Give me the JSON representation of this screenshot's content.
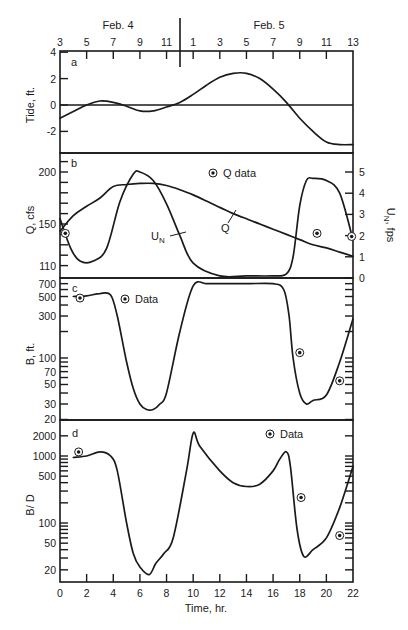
{
  "figure": {
    "top_axis": {
      "date_labels": [
        "Feb. 4",
        "Feb. 5"
      ],
      "hour_ticks": [
        "3",
        "5",
        "7",
        "9",
        "11",
        "1",
        "3",
        "5",
        "7",
        "9",
        "11",
        "13"
      ]
    },
    "bottom_axis": {
      "label": "Time, hr.",
      "ticks": [
        "0",
        "2",
        "4",
        "6",
        "8",
        "10",
        "12",
        "14",
        "16",
        "18",
        "20",
        "22"
      ]
    },
    "panels": {
      "a": {
        "letter": "a",
        "ylabel": "Tide, ft.",
        "yticks": [
          "4",
          "2",
          "0",
          "-2"
        ]
      },
      "b": {
        "letter": "b",
        "ylabel": "Q, cfs",
        "yticks": [
          "200",
          "150",
          "110"
        ],
        "ylabel_right": "U",
        "ylabel_right_sub": "N",
        "ylabel_right_unit": ", fps",
        "yticks_right": [
          "5",
          "4",
          "3",
          "2",
          "1",
          "0"
        ],
        "legend": "Q data",
        "curve_label_q": "Q",
        "curve_label_un": "U",
        "curve_label_un_sub": "N"
      },
      "c": {
        "letter": "c",
        "ylabel": "B, ft.",
        "yticks": [
          "700",
          "500",
          "300",
          "100",
          "70",
          "50",
          "30",
          "20"
        ],
        "legend": "Data"
      },
      "d": {
        "letter": "d",
        "ylabel": "B/ D",
        "yticks": [
          "2000",
          "1000",
          "500",
          "100",
          "50",
          "20"
        ],
        "legend": "Data"
      }
    }
  },
  "chart_data": [
    {
      "type": "line",
      "title": "a",
      "xlabel": "Time, hr.",
      "ylabel": "Tide, ft.",
      "xlim": [
        0,
        22
      ],
      "ylim": [
        -3.8,
        4
      ],
      "series": [
        {
          "name": "Tide",
          "x": [
            0,
            1,
            2,
            3,
            4,
            5,
            6,
            7,
            8,
            9,
            10,
            11,
            12,
            13,
            14,
            15,
            16,
            17,
            18,
            19,
            20,
            21,
            22
          ],
          "y": [
            -1.0,
            -0.5,
            0.0,
            0.3,
            0.2,
            -0.1,
            -0.45,
            -0.45,
            -0.15,
            0.2,
            0.8,
            1.5,
            2.1,
            2.4,
            2.4,
            2.0,
            1.2,
            0.2,
            -1.0,
            -2.0,
            -2.8,
            -3.0,
            -3.0
          ]
        }
      ],
      "reference_line": 0
    },
    {
      "type": "line",
      "title": "b",
      "xlabel": "Time, hr.",
      "ylabel": "Q, cfs",
      "ylabel_right": "U_N, fps",
      "xlim": [
        0,
        22
      ],
      "ylim": [
        108,
        218
      ],
      "ylim_right": [
        0,
        5.9
      ],
      "legend": [
        "Q data"
      ],
      "series": [
        {
          "name": "Q",
          "axis": "left",
          "x": [
            0,
            1,
            2,
            3,
            4,
            5,
            6,
            7,
            8,
            9,
            10,
            11,
            12,
            13,
            14,
            15,
            16,
            17,
            18,
            19,
            20,
            21,
            22
          ],
          "y": [
            143,
            158,
            167,
            175,
            186,
            188,
            189,
            189,
            187,
            183,
            178,
            172,
            166,
            160,
            155,
            150,
            145,
            140,
            135,
            130,
            127,
            123,
            119
          ]
        },
        {
          "name": "U_N",
          "axis": "right",
          "x": [
            0,
            0.8,
            1.5,
            2.5,
            3.5,
            4.5,
            5.5,
            6.0,
            7.0,
            8.0,
            9.0,
            10.0,
            12.0,
            14.0,
            16.0,
            17.0,
            17.5,
            18.0,
            18.5,
            19.0,
            20.0,
            21.0,
            22.0
          ],
          "y": [
            2.8,
            1.4,
            0.8,
            0.8,
            1.4,
            3.6,
            4.9,
            5.0,
            4.6,
            3.5,
            2.0,
            0.7,
            0.1,
            0.1,
            0.1,
            0.2,
            1.0,
            3.4,
            4.6,
            4.7,
            4.6,
            4.0,
            1.8
          ]
        },
        {
          "name": "Q data",
          "type": "scatter",
          "axis": "left",
          "x": [
            0.4,
            19.3,
            21.9
          ],
          "y": [
            141,
            141,
            138
          ]
        }
      ]
    },
    {
      "type": "line",
      "title": "c",
      "xlabel": "Time, hr.",
      "ylabel": "B, ft.",
      "yscale": "log",
      "xlim": [
        0,
        22
      ],
      "ylim": [
        20,
        760
      ],
      "legend": [
        "Data"
      ],
      "series": [
        {
          "name": "B",
          "x": [
            1,
            2,
            3,
            3.8,
            4.3,
            5,
            5.5,
            6,
            6.5,
            7,
            7.5,
            8,
            9,
            10,
            11,
            12,
            14,
            16,
            16.8,
            17.2,
            17.5,
            18,
            18.5,
            19,
            20,
            21,
            22
          ],
          "y": [
            500,
            510,
            540,
            520,
            300,
            90,
            45,
            30,
            26,
            26,
            30,
            40,
            200,
            660,
            700,
            700,
            700,
            700,
            600,
            300,
            100,
            40,
            30,
            33,
            38,
            90,
            280
          ]
        },
        {
          "name": "Data",
          "type": "scatter",
          "x": [
            1.5,
            18.0,
            21.0
          ],
          "y": [
            480,
            115,
            55
          ]
        }
      ]
    },
    {
      "type": "line",
      "title": "d",
      "xlabel": "Time, hr.",
      "ylabel": "B/ D",
      "yscale": "log",
      "xlim": [
        0,
        22
      ],
      "ylim": [
        15,
        2600
      ],
      "legend": [
        "Data"
      ],
      "series": [
        {
          "name": "B/D",
          "x": [
            1,
            2,
            3,
            3.8,
            4.3,
            5,
            5.5,
            6,
            6.7,
            7.2,
            7.8,
            8.5,
            9.5,
            10,
            10.5,
            12,
            13,
            14,
            15,
            16,
            16.5,
            17,
            17.3,
            17.8,
            18.3,
            19,
            20,
            21,
            22
          ],
          "y": [
            950,
            1000,
            1150,
            1000,
            600,
            100,
            35,
            22,
            17,
            25,
            35,
            60,
            600,
            2200,
            1400,
            600,
            400,
            350,
            380,
            600,
            900,
            1150,
            700,
            80,
            32,
            40,
            60,
            170,
            700
          ]
        },
        {
          "name": "Data",
          "type": "scatter",
          "x": [
            1.4,
            18.1,
            21.0
          ],
          "y": [
            1150,
            240,
            65
          ]
        }
      ]
    }
  ]
}
